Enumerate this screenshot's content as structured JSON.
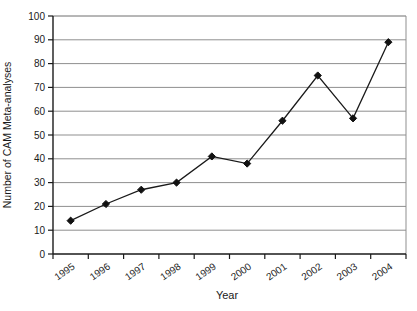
{
  "page": {
    "background": "#ffffff"
  },
  "chart_data": {
    "type": "line",
    "title": "",
    "xlabel": "Year",
    "ylabel": "Number of CAM Meta-analyses",
    "categories": [
      "1995",
      "1996",
      "1997",
      "1998",
      "1999",
      "2000",
      "2001",
      "2002",
      "2003",
      "2004"
    ],
    "values": [
      14,
      21,
      27,
      30,
      41,
      38,
      56,
      75,
      57,
      89
    ],
    "ylim": [
      0,
      100
    ],
    "yticks": [
      0,
      10,
      20,
      30,
      40,
      50,
      60,
      70,
      80,
      90,
      100
    ],
    "grid": "horizontal-only",
    "legend": "none",
    "marker": "diamond",
    "colors": {
      "line": "#1a1a1a",
      "marker": "#111111",
      "grid": "#8f8f8f",
      "frame": "#6e6e6e",
      "axis": "#1a1a1a",
      "text": "#1a1a1a",
      "background": "#ffffff"
    }
  }
}
